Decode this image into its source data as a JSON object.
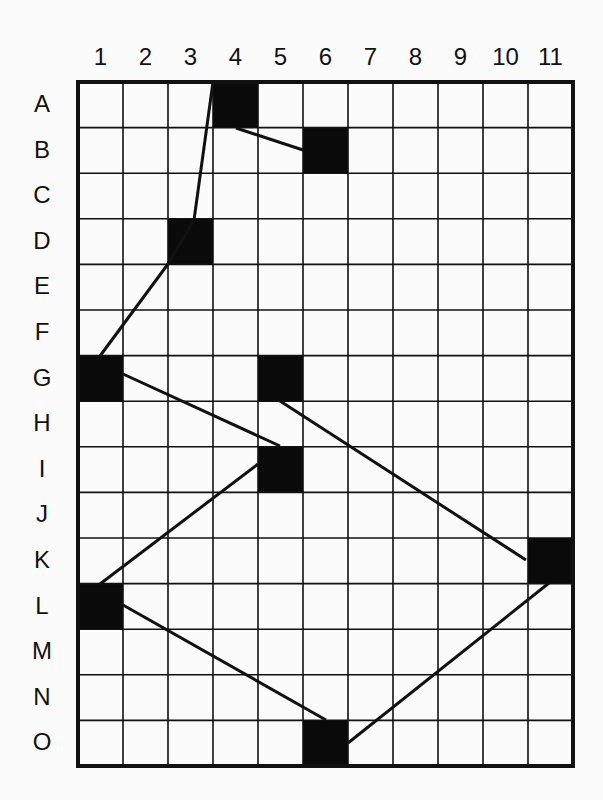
{
  "grid": {
    "columns": [
      "1",
      "2",
      "3",
      "4",
      "5",
      "6",
      "7",
      "8",
      "9",
      "10",
      "11"
    ],
    "rows": [
      "A",
      "B",
      "C",
      "D",
      "E",
      "F",
      "G",
      "H",
      "I",
      "J",
      "K",
      "L",
      "M",
      "N",
      "O"
    ],
    "origin_x": 78,
    "origin_y": 82,
    "cell_w": 45,
    "cell_h": 45.6,
    "line_color": "#111111",
    "fill_color": "#0a0a0a"
  },
  "filled_cells": [
    {
      "row": "A",
      "col": 4
    },
    {
      "row": "B",
      "col": 6
    },
    {
      "row": "D",
      "col": 3
    },
    {
      "row": "G",
      "col": 1
    },
    {
      "row": "G",
      "col": 5
    },
    {
      "row": "I",
      "col": 5
    },
    {
      "row": "K",
      "col": 11
    },
    {
      "row": "L",
      "col": 1
    },
    {
      "row": "O",
      "col": 6
    }
  ],
  "connections": [
    {
      "from": [
        213,
        82
      ],
      "to": [
        194,
        220
      ]
    },
    {
      "from": [
        236,
        128
      ],
      "to": [
        303,
        150
      ]
    },
    {
      "from": [
        194,
        220
      ],
      "to": [
        168,
        264
      ]
    },
    {
      "from": [
        168,
        264
      ],
      "to": [
        100,
        356
      ]
    },
    {
      "from": [
        123,
        374
      ],
      "to": [
        280,
        446
      ]
    },
    {
      "from": [
        280,
        401
      ],
      "to": [
        526,
        560
      ]
    },
    {
      "from": [
        258,
        464
      ],
      "to": [
        100,
        584
      ]
    },
    {
      "from": [
        123,
        605
      ],
      "to": [
        326,
        720
      ]
    },
    {
      "from": [
        348,
        743
      ],
      "to": [
        549,
        583
      ]
    }
  ]
}
